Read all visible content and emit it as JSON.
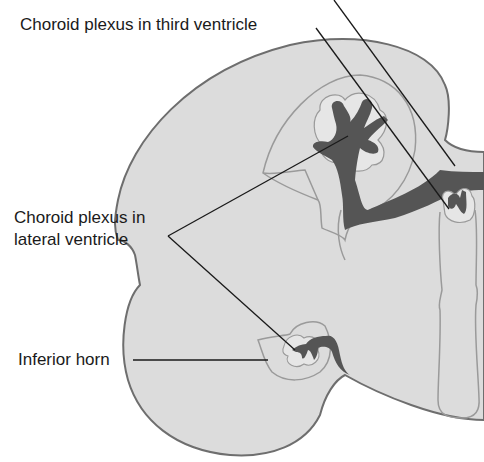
{
  "figure": {
    "type": "anatomical-diagram",
    "colors": {
      "tissue_fill": "#dcdcdc",
      "tissue_outline": "#6e6e6e",
      "ventricle_line": "#9a9a9a",
      "plexus_fill": "#555555",
      "leader_line": "#1a1a1a",
      "background": "#ffffff"
    }
  },
  "labels": {
    "third_ventricle": "Choroid plexus in third ventricle",
    "lateral_line1": "Choroid plexus in",
    "lateral_line2": "lateral ventricle",
    "inferior_horn": "Inferior horn"
  }
}
